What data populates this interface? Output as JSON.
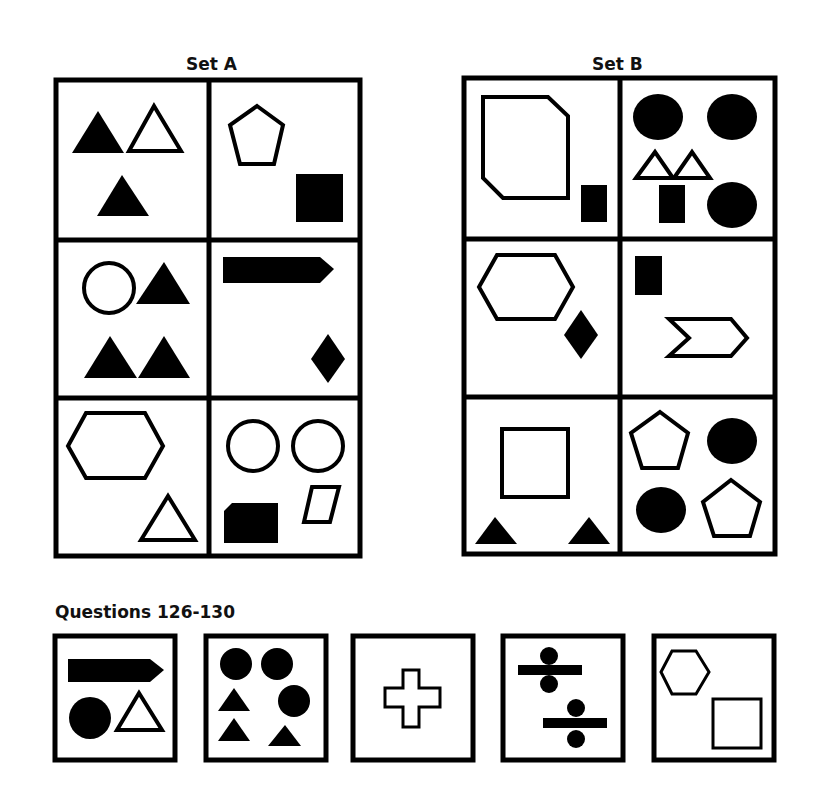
{
  "set_a": {
    "title": "Set A",
    "panels": [
      "two black triangles and one white triangle",
      "white pentagon and black square",
      "white circle and three black triangles",
      "black arrow bar and black diamond",
      "white hexagon and white triangle",
      "two white circles, black cut-corner square and white parallelogram"
    ]
  },
  "set_b": {
    "title": "Set B",
    "panels": [
      "white cut-corner polygon and black rectangle",
      "three black circles, two white triangles and black rectangle",
      "white hexagon and black diamond",
      "black rectangle and white chevron",
      "white square and two black triangles",
      "two white pentagons and two black circles"
    ]
  },
  "questions": {
    "title": "Questions 126-130",
    "items": [
      {
        "number": "126",
        "description": "black arrow bar, black circle, white triangle"
      },
      {
        "number": "127",
        "description": "three black circles and three black triangles"
      },
      {
        "number": "128",
        "description": "white cross"
      },
      {
        "number": "129",
        "description": "two division signs"
      },
      {
        "number": "130",
        "description": "white hexagon and white square"
      }
    ]
  }
}
